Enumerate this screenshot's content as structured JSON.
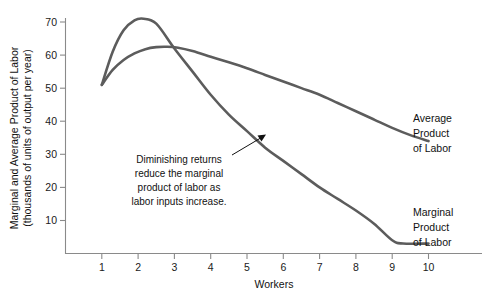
{
  "chart_data": {
    "type": "line",
    "title": "",
    "xlabel": "Workers",
    "ylabel_line1": "Marginal and Average Product of Labor",
    "ylabel_line2": "(thousands of units of output per year)",
    "xlim": [
      0,
      11
    ],
    "ylim": [
      0,
      75
    ],
    "grid": false,
    "legend_position": "inline-right-of-curve-ends",
    "xticks": [
      "1",
      "2",
      "3",
      "4",
      "5",
      "6",
      "7",
      "8",
      "9",
      "10"
    ],
    "xtick_values": [
      1,
      2,
      3,
      4,
      5,
      6,
      7,
      8,
      9,
      10
    ],
    "yticks": [
      "10",
      "20",
      "30",
      "40",
      "50",
      "60",
      "70"
    ],
    "ytick_values": [
      10,
      20,
      30,
      40,
      50,
      60,
      70
    ],
    "curve_color": "#5c5c5c",
    "axis_color": "#8a8a8a",
    "series": [
      {
        "name": "Marginal Product of Labor",
        "label_line1": "Marginal",
        "label_line2": "Product",
        "label_line3": "of Labor",
        "x": [
          1.0,
          1.3,
          1.6,
          1.9,
          2.15,
          2.5,
          3.0,
          3.5,
          4.0,
          4.5,
          5.0,
          5.5,
          6.0,
          6.5,
          7.0,
          7.5,
          8.0,
          8.5,
          9.0,
          9.3,
          10.0
        ],
        "values": [
          51,
          61,
          67.5,
          70.5,
          71,
          69.5,
          62,
          55,
          48,
          42,
          37,
          32,
          28,
          24,
          20,
          16.5,
          13,
          9,
          4,
          3,
          3
        ]
      },
      {
        "name": "Average Product of Labor",
        "label_line1": "Average",
        "label_line2": "Product",
        "label_line3": "of Labor",
        "x": [
          1.0,
          1.3,
          1.6,
          1.9,
          2.2,
          2.5,
          2.8,
          3.1,
          3.5,
          4.0,
          4.5,
          5.0,
          5.5,
          6.0,
          6.5,
          7.0,
          7.5,
          8.0,
          8.5,
          9.0,
          9.5,
          10.0
        ],
        "values": [
          51,
          55.5,
          58.5,
          60.5,
          61.8,
          62.4,
          62.5,
          62.2,
          61.2,
          59.5,
          57.8,
          56,
          54,
          52,
          50,
          48,
          45.5,
          43,
          40.5,
          38,
          35.8,
          34
        ]
      }
    ],
    "annotations": [
      {
        "name": "diminishing-returns-note",
        "line1": "Diminishing returns",
        "line2": "reduce the marginal",
        "line3": "product of labor as",
        "line4": "labor inputs increase.",
        "points_to_series": "Marginal Product of Labor"
      }
    ]
  }
}
